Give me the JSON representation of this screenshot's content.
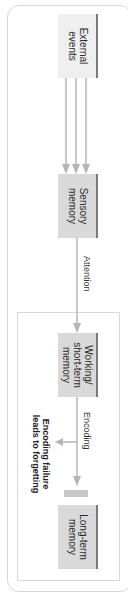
{
  "diagram": {
    "type": "memory-model-flow",
    "orientation": "rotated-90",
    "nodes": [
      {
        "id": "external",
        "label": "External events"
      },
      {
        "id": "sensory",
        "label": "Sensory memory"
      },
      {
        "id": "working",
        "label": "Working/ short-term memory"
      },
      {
        "id": "longterm",
        "label": "Long-term memory"
      }
    ],
    "edges": [
      {
        "from": "external",
        "to": "sensory",
        "label": ""
      },
      {
        "from": "sensory",
        "to": "working",
        "label": "Attention"
      },
      {
        "from": "working",
        "to": "longterm",
        "label": "Encoding"
      }
    ],
    "annotations": {
      "forgetting": "Encoding failure leads to forgetting"
    },
    "colors": {
      "box_light": "#efefef",
      "box_gray": "#d9d9d9",
      "arrow": "#b5b5b5",
      "border": "#d6d6d6"
    }
  }
}
